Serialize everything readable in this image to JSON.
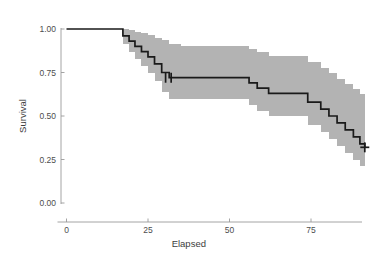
{
  "chart_data": {
    "type": "line",
    "subtype": "kaplan-meier-survival-step",
    "title": "",
    "xlabel": "Elapsed",
    "ylabel": "Survival",
    "xlim": [
      -2,
      95
    ],
    "ylim": [
      0.0,
      1.0
    ],
    "grid": false,
    "legend": null,
    "xticks": [
      0,
      25,
      50,
      75
    ],
    "xtick_labels": [
      "0",
      "25",
      "50",
      "75"
    ],
    "yticks": [
      0.0,
      0.25,
      0.5,
      0.75,
      1.0
    ],
    "ytick_labels": [
      "0.00",
      "0.25",
      "0.50",
      "0.75",
      "1.00"
    ],
    "colors": {
      "step_line": "#1a1a1a",
      "confidence_band": "#b3b3b3",
      "axis": "#9a9a9a",
      "text": "#4d4d4d",
      "background": "#ffffff"
    },
    "series": [
      {
        "name": "Survival estimate",
        "type": "step",
        "x": [
          0,
          15.5,
          17.3,
          19.2,
          21.0,
          23.0,
          25.0,
          27.0,
          29.2,
          31.5,
          35.0,
          52.0,
          56.0,
          58.5,
          62.0,
          70.5,
          74.0,
          78.0,
          80.5,
          83.0,
          85.5,
          88.0,
          90.0,
          91.5
        ],
        "y": [
          1.0,
          1.0,
          0.96,
          0.93,
          0.9,
          0.87,
          0.84,
          0.8,
          0.75,
          0.72,
          0.72,
          0.72,
          0.69,
          0.66,
          0.63,
          0.63,
          0.58,
          0.54,
          0.5,
          0.46,
          0.42,
          0.38,
          0.34,
          0.32
        ]
      },
      {
        "name": "Upper 95% confidence limit",
        "type": "step",
        "x": [
          15.5,
          17.3,
          19.2,
          21.0,
          23.0,
          25.0,
          27.0,
          29.2,
          31.5,
          35.0,
          52.0,
          56.0,
          58.5,
          62.0,
          70.5,
          74.0,
          78.0,
          80.5,
          83.0,
          85.5,
          88.0,
          90.0,
          91.5
        ],
        "y": [
          1.0,
          1.0,
          0.995,
          0.985,
          0.975,
          0.965,
          0.95,
          0.935,
          0.915,
          0.905,
          0.905,
          0.885,
          0.865,
          0.845,
          0.845,
          0.81,
          0.775,
          0.745,
          0.715,
          0.685,
          0.655,
          0.625,
          0.605
        ]
      },
      {
        "name": "Lower 95% confidence limit",
        "type": "step",
        "x": [
          15.5,
          17.3,
          19.2,
          21.0,
          23.0,
          25.0,
          27.0,
          29.2,
          31.5,
          35.0,
          52.0,
          56.0,
          58.5,
          62.0,
          70.5,
          74.0,
          78.0,
          80.5,
          83.0,
          85.5,
          88.0,
          90.0,
          91.5
        ],
        "y": [
          1.0,
          0.915,
          0.865,
          0.825,
          0.785,
          0.745,
          0.7,
          0.64,
          0.6,
          0.6,
          0.6,
          0.565,
          0.53,
          0.5,
          0.5,
          0.45,
          0.41,
          0.37,
          0.33,
          0.29,
          0.25,
          0.21,
          0.175
        ]
      }
    ],
    "censor_marks": [
      {
        "x": 30.4,
        "y": 0.72
      },
      {
        "x": 32.1,
        "y": 0.72
      },
      {
        "x": 91.5,
        "y": 0.32
      }
    ],
    "annotations": []
  }
}
